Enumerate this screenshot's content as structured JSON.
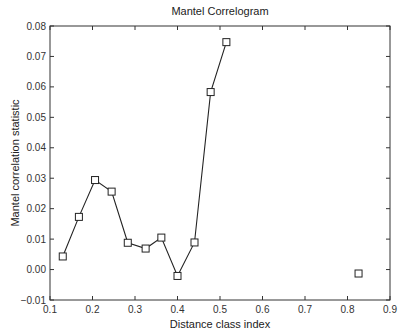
{
  "chart_data": {
    "type": "line",
    "title": "Mantel Correlogram",
    "xlabel": "Distance class index",
    "ylabel": "Mantel correlation statistic",
    "xlim": [
      0.1,
      0.9
    ],
    "ylim": [
      -0.01,
      0.08
    ],
    "xticks": [
      "0.1",
      "0.2",
      "0.3",
      "0.4",
      "0.5",
      "0.6",
      "0.7",
      "0.8",
      "0.9"
    ],
    "yticks": [
      "-0.01",
      "0.00",
      "0.01",
      "0.02",
      "0.03",
      "0.04",
      "0.05",
      "0.06",
      "0.07",
      "0.08"
    ],
    "grid": false,
    "legend": null,
    "marker": "square",
    "series": [
      {
        "name": "connected",
        "x": [
          0.13,
          0.168,
          0.206,
          0.245,
          0.283,
          0.325,
          0.362,
          0.4,
          0.44,
          0.478,
          0.515
        ],
        "y": [
          0.0043,
          0.0173,
          0.0294,
          0.0256,
          0.0088,
          0.0069,
          0.0105,
          -0.0021,
          0.0089,
          0.0583,
          0.0747
        ]
      },
      {
        "name": "isolated",
        "x": [
          0.826
        ],
        "y": [
          -0.0013
        ]
      }
    ]
  }
}
